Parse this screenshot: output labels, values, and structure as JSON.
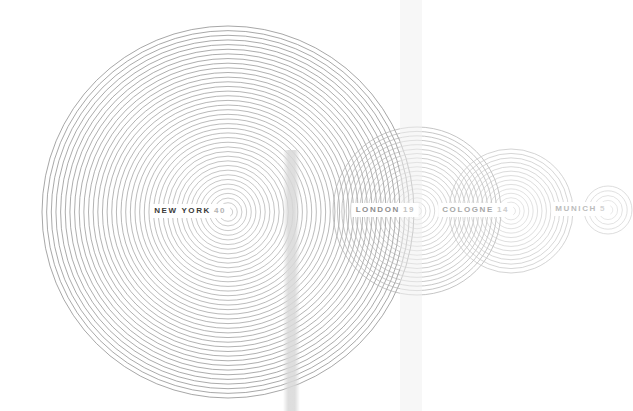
{
  "canvas": {
    "width": 633,
    "height": 411,
    "background": "#ffffff"
  },
  "chart_data": {
    "type": "scatter",
    "title": "",
    "subtitle": "",
    "xlabel": "",
    "ylabel": "",
    "grid": false,
    "legend": "none",
    "encoding": "Each city is drawn as a set of concentric rings; the number of rings equals the city value.",
    "categories": [
      "NEW YORK",
      "LONDON",
      "COLOGNE",
      "MUNICH"
    ],
    "values": [
      40,
      19,
      14,
      5
    ],
    "series": [
      {
        "name": "rings",
        "values": [
          40,
          19,
          14,
          5
        ]
      }
    ],
    "points": [
      {
        "label": "NEW YORK",
        "value": 40,
        "cx": 228,
        "cy": 212,
        "radius": 186,
        "ring_step": 4.65,
        "stroke": "#8a8a8a",
        "label_x": 230,
        "label_y": 211,
        "label_class": ""
      },
      {
        "label": "LONDON",
        "value": 19,
        "cx": 417,
        "cy": 211,
        "radius": 84,
        "ring_step": 4.4,
        "stroke": "#b2b2b2",
        "label_x": 419,
        "label_y": 210,
        "label_class": "lbl-dim"
      },
      {
        "label": "COLOGNE",
        "value": 14,
        "cx": 511,
        "cy": 211,
        "radius": 62,
        "ring_step": 4.4,
        "stroke": "#c6c6c6",
        "label_x": 513,
        "label_y": 210,
        "label_class": "lbl-dimmer"
      },
      {
        "label": "MUNICH",
        "value": 5,
        "cx": 608,
        "cy": 210,
        "radius": 24,
        "ring_step": 4.6,
        "stroke": "#d2d2d2",
        "label_x": 610,
        "label_y": 209,
        "label_class": "lbl-dimmest"
      }
    ],
    "overlays": [
      {
        "name": "vertical-band",
        "x": 400,
        "y": 0,
        "width": 22,
        "height": 411,
        "color": "#f0f0f0"
      },
      {
        "name": "vertical-smudge",
        "x": 283,
        "y": 150,
        "width": 17,
        "height": 261,
        "color": "#d8d8d8"
      }
    ]
  },
  "labels": {
    "new_york": {
      "name": "NEW YORK",
      "count": "40",
      "count_color": "#b4b4b4"
    },
    "london": {
      "name": "LONDON",
      "count": "19",
      "count_color": "#c2c2c2"
    },
    "cologne": {
      "name": "COLOGNE",
      "count": "14",
      "count_color": "#cccccc"
    },
    "munich": {
      "name": "MUNICH",
      "count": "5",
      "count_color": "#d4d4d4"
    }
  }
}
